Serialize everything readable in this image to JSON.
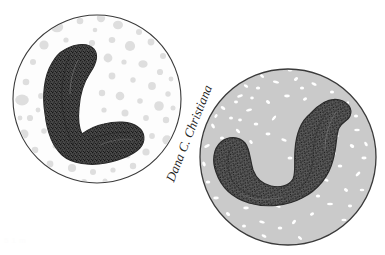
{
  "figure": {
    "title": "Comparison of two white blood cells",
    "background_color": "#ffffff",
    "width": 385,
    "height": 255,
    "outline_color": "#3a3a3a",
    "panels": [
      {
        "id": "left-cell",
        "label": "Left cell",
        "description": "Band neutrophil with pale cytoplasm and scattered pale gray granules",
        "center_x": 97,
        "center_y": 99,
        "radius": 84,
        "cytoplasm_color": "#fdfdfd",
        "granule_color": "#dedede",
        "granule_count": 62,
        "granule_min_radius": 2.2,
        "granule_max_radius": 6.5,
        "granule_style": "round-sparse",
        "nucleus": {
          "name": "band-nucleus",
          "shape": "hooked-band",
          "fill_color": "#3d3d3d",
          "stipple_color": "#1a1a1a",
          "outline_color": "#2b2b2b",
          "path": "M 52 63 C 44 76 42 96 45 114 C 47 131 52 146 62 155 C 72 164 90 166 106 163 C 120 160 133 155 140 148 C 146 141 145 132 138 127 C 130 121 116 121 104 124 C 94 126 86 131 82 134 C 79 128 78 118 79 108 C 80 94 84 82 90 73 C 96 64 99 55 94 49 C 88 42 75 44 66 49 C 58 53 55 58 52 63 Z"
        }
      },
      {
        "id": "right-cell",
        "label": "Right cell",
        "description": "Band neutrophil with dense gray cytoplasm and fine white granules",
        "center_x": 288,
        "center_y": 157,
        "radius": 88,
        "cytoplasm_color": "#cacaca",
        "granule_color": "#ffffff",
        "granule_count": 240,
        "granule_min_radius": 1.0,
        "granule_max_radius": 3.2,
        "granule_style": "fine-dense",
        "nucleus": {
          "name": "band-nucleus",
          "shape": "horseshoe",
          "fill_color": "#555555",
          "stipple_color": "#1d1d1d",
          "outline_color": "#2b2b2b",
          "path": "M 310 114 C 300 122 296 136 295 150 C 294 163 296 173 293 179 C 289 186 280 188 271 186 C 262 184 256 178 253 170 C 250 160 250 149 245 143 C 239 136 228 136 221 142 C 213 149 212 161 216 172 C 221 187 233 198 249 203 C 266 208 287 206 302 198 C 318 190 329 176 333 160 C 337 146 336 134 339 128 C 343 121 348 121 350 116 C 353 109 348 102 340 100 C 329 97 318 105 310 114 Z"
        }
      }
    ],
    "signature": {
      "name": "artist-signature",
      "text": "Dana C. Christiana",
      "rotation_deg": -68,
      "x": 193,
      "y": 135,
      "color": "#262626",
      "font_size": 13
    },
    "faint_caption": {
      "text": "5 1 m",
      "color": "#fdfdfd"
    }
  }
}
